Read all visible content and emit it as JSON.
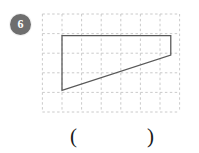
{
  "problem": {
    "number": "6",
    "badge_color": "#6e6e6e",
    "badge_text_color": "#ffffff"
  },
  "figure": {
    "grid": {
      "columns": 7,
      "rows": 5,
      "cell_size": 20,
      "line_color": "#c9c9c9",
      "line_style": "dashed",
      "origin_x": 0,
      "origin_y": 0,
      "width": 140,
      "height": 100
    },
    "shape": {
      "name": "trapezoid",
      "stroke_color": "#595959",
      "stroke_width": 1.3,
      "fill": "none",
      "vertices": [
        {
          "label": "top-left",
          "x": 20,
          "y": 22
        },
        {
          "label": "top-right",
          "x": 131,
          "y": 22
        },
        {
          "label": "right-bottom",
          "x": 131,
          "y": 42
        },
        {
          "label": "bottom-left",
          "x": 20,
          "y": 78
        }
      ],
      "vertices_grid_units": [
        {
          "label": "top-left",
          "col": 1,
          "row": 1
        },
        {
          "label": "top-right",
          "col": 6.55,
          "row": 1
        },
        {
          "label": "right-bottom",
          "col": 6.55,
          "row": 2
        },
        {
          "label": "bottom-left",
          "col": 1,
          "row": 3.8
        }
      ]
    }
  },
  "answer": {
    "open_paren": "(",
    "close_paren": ")",
    "value": ""
  }
}
